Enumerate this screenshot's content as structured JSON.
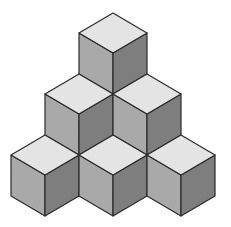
{
  "figure": {
    "cube_count": 6,
    "rows": [
      1,
      2,
      3
    ],
    "colors": {
      "top": "#e4e4e4",
      "left": "#a9a9a9",
      "right": "#7e7e7e",
      "stroke": "#2a2a2a",
      "background": "#ffffff"
    },
    "cubes": [
      {
        "row": 1,
        "x": 113,
        "y": 13
      },
      {
        "row": 2,
        "x": 79,
        "y": 74
      },
      {
        "row": 2,
        "x": 147,
        "y": 74
      },
      {
        "row": 3,
        "x": 45,
        "y": 135
      },
      {
        "row": 3,
        "x": 113,
        "y": 135
      },
      {
        "row": 3,
        "x": 181,
        "y": 135
      }
    ],
    "geometry": {
      "half_width": 34,
      "half_diamond": 20,
      "side_height": 41
    }
  }
}
